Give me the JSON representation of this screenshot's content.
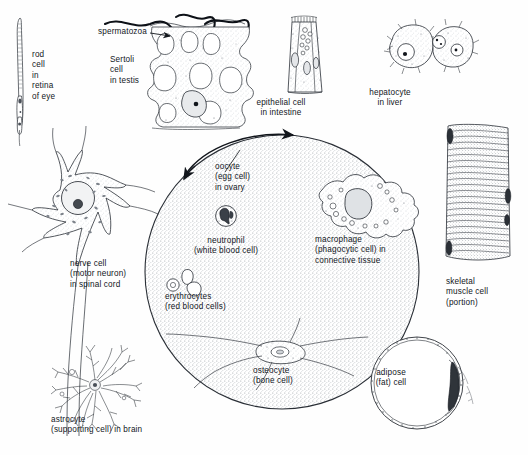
{
  "figure": {
    "background_color": "#fefefe",
    "ink_color": "#12161c",
    "stipple_color": "#9aa0a6",
    "width": 528,
    "height": 455
  },
  "labels": {
    "rod_cell": {
      "text": "rod\ncell\nin\nretina\nof eye",
      "x": 32,
      "y": 55,
      "align": "left"
    },
    "spermatozoa": {
      "text": "spermatozoa",
      "x": 98,
      "y": 31,
      "align": "left"
    },
    "sertoli_cell": {
      "text": "Sertoli\ncell\nin testis",
      "x": 110,
      "y": 61,
      "align": "left"
    },
    "epithelial_cell": {
      "text": "epithelial cell\nin intestine",
      "x": 281,
      "y": 101,
      "align": "center"
    },
    "hepatocyte": {
      "text": "hepatocyte\nin liver",
      "x": 390,
      "y": 92,
      "align": "center"
    },
    "oocyte": {
      "text": "oocyte\n(egg cell)\nin ovary",
      "x": 215,
      "y": 166,
      "align": "left"
    },
    "macrophage": {
      "text": "macrophage\n(phagocytic cell) in\nconnective tissue",
      "x": 315,
      "y": 223,
      "align": "left"
    },
    "neutrophil": {
      "text": "neutrophil\n(white blood cell)",
      "x": 226,
      "y": 240,
      "align": "center"
    },
    "erythrocytes": {
      "text": "erythrocytes\n(red blood cells)",
      "x": 165,
      "y": 288,
      "align": "left"
    },
    "nerve_cell": {
      "text": "nerve cell\n(motor neuron)\nin spinal cord",
      "x": 70,
      "y": 260,
      "align": "left"
    },
    "astrocyte": {
      "text": "astrocyte\n(supporting cell) in brain",
      "x": 67,
      "y": 420,
      "align": "left"
    },
    "osteocyte": {
      "text": "osteocyte\n(bone cell)",
      "x": 253,
      "y": 362,
      "align": "left"
    },
    "adipose": {
      "text": "adipose\n(fat) cell",
      "x": 391,
      "y": 363,
      "align": "center"
    },
    "skeletal_muscle": {
      "text": "skeletal\nmuscle cell\n(portion)",
      "x": 446,
      "y": 281,
      "align": "left"
    }
  },
  "cells": [
    {
      "name": "rod-cell",
      "label_key": "rod_cell",
      "region": "retina of eye"
    },
    {
      "name": "sertoli-cell",
      "label_key": "sertoli_cell",
      "region": "testis"
    },
    {
      "name": "spermatozoa",
      "label_key": "spermatozoa",
      "region": "testis"
    },
    {
      "name": "epithelial-cell",
      "label_key": "epithelial_cell",
      "region": "intestine"
    },
    {
      "name": "hepatocyte",
      "label_key": "hepatocyte",
      "region": "liver"
    },
    {
      "name": "oocyte",
      "label_key": "oocyte",
      "region": "ovary"
    },
    {
      "name": "macrophage",
      "label_key": "macrophage",
      "region": "connective tissue"
    },
    {
      "name": "neutrophil",
      "label_key": "neutrophil",
      "region": "blood"
    },
    {
      "name": "erythrocytes",
      "label_key": "erythrocytes",
      "region": "blood"
    },
    {
      "name": "nerve-cell",
      "label_key": "nerve_cell",
      "region": "spinal cord"
    },
    {
      "name": "astrocyte",
      "label_key": "astrocyte",
      "region": "brain"
    },
    {
      "name": "osteocyte",
      "label_key": "osteocyte",
      "region": "bone"
    },
    {
      "name": "adipose-cell",
      "label_key": "adipose",
      "region": "adipose tissue"
    },
    {
      "name": "skeletal-muscle-cell",
      "label_key": "skeletal_muscle",
      "region": "skeletal muscle"
    }
  ]
}
